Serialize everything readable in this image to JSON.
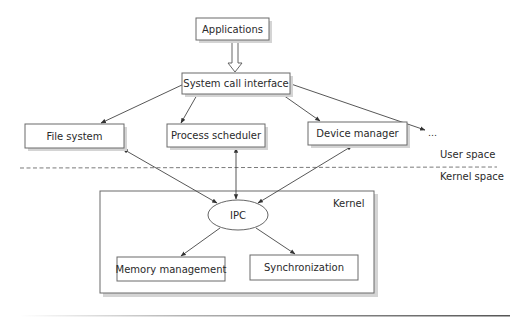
{
  "diagram": {
    "nodes": {
      "applications": "Applications",
      "system_call_interface": "System call interface",
      "file_system": "File system",
      "process_scheduler": "Process scheduler",
      "device_manager": "Device manager",
      "ellipsis": "...",
      "ipc": "IPC",
      "memory_management": "Memory management",
      "synchronization": "Synchronization"
    },
    "regions": {
      "user_space": "User space",
      "kernel_space": "Kernel space",
      "kernel": "Kernel"
    },
    "edges": [
      {
        "from": "Applications",
        "to": "System call interface",
        "style": "hollow-double-arrow"
      },
      {
        "from": "System call interface",
        "to": "File system",
        "style": "arrow"
      },
      {
        "from": "System call interface",
        "to": "Process scheduler",
        "style": "arrow"
      },
      {
        "from": "System call interface",
        "to": "Device manager",
        "style": "arrow"
      },
      {
        "from": "System call interface",
        "to": "...",
        "style": "arrow"
      },
      {
        "from": "File system",
        "to": "IPC",
        "style": "bidirectional"
      },
      {
        "from": "Process scheduler",
        "to": "IPC",
        "style": "bidirectional"
      },
      {
        "from": "Device manager",
        "to": "IPC",
        "style": "bidirectional"
      },
      {
        "from": "IPC",
        "to": "Memory management",
        "style": "arrow"
      },
      {
        "from": "IPC",
        "to": "Synchronization",
        "style": "arrow"
      }
    ],
    "colors": {
      "stroke": "#444444",
      "box_border": "#6a6a6a",
      "shadow": "#d4d4d4",
      "text": "#2a2a2a"
    }
  }
}
